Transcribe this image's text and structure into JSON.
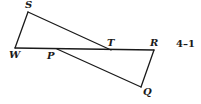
{
  "figure": {
    "label": "4–1",
    "points": {
      "S": {
        "label": "S",
        "x": 28,
        "y": 12,
        "lx": 25,
        "ly": 8
      },
      "W": {
        "label": "W",
        "x": 15,
        "y": 48,
        "lx": 9,
        "ly": 58
      },
      "P": {
        "label": "P",
        "x": 57,
        "y": 49,
        "lx": 47,
        "ly": 59
      },
      "T": {
        "label": "T",
        "x": 111,
        "y": 50,
        "lx": 107,
        "ly": 46
      },
      "R": {
        "label": "R",
        "x": 154,
        "y": 50,
        "lx": 150,
        "ly": 46
      },
      "Q": {
        "label": "Q",
        "x": 141,
        "y": 87,
        "lx": 143,
        "ly": 95
      }
    },
    "segments": [
      [
        "S",
        "W"
      ],
      [
        "S",
        "T"
      ],
      [
        "W",
        "R"
      ],
      [
        "P",
        "Q"
      ],
      [
        "Q",
        "R"
      ]
    ]
  }
}
